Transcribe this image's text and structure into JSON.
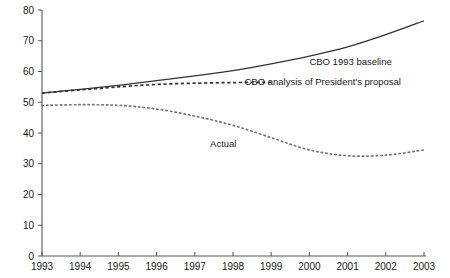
{
  "chart_data": {
    "type": "line",
    "title": "",
    "subtitle": "",
    "xlabel": "",
    "ylabel": "",
    "x": [
      1993,
      1994,
      1995,
      1996,
      1997,
      1998,
      1999,
      2000,
      2001,
      2002,
      2003
    ],
    "x_tick_labels": [
      "1993",
      "1994",
      "1995",
      "1996",
      "1997",
      "1998",
      "1999",
      "2000",
      "2001",
      "2002",
      "2003"
    ],
    "y_tick_labels": [
      "0",
      "10",
      "20",
      "30",
      "40",
      "50",
      "60",
      "70",
      "80"
    ],
    "y_ticks": [
      0,
      10,
      20,
      30,
      40,
      50,
      60,
      70,
      80
    ],
    "xlim": [
      1993,
      2003
    ],
    "ylim": [
      0,
      80
    ],
    "grid": false,
    "legend_position": "inline-annotations",
    "series": [
      {
        "name": "CBO 1993 baseline",
        "style": "solid",
        "color": "#333333",
        "x": [
          1993,
          1994,
          1995,
          1996,
          1997,
          1998,
          1999,
          2000,
          2001,
          2002,
          2003
        ],
        "values": [
          53.0,
          54.2,
          55.5,
          57.0,
          58.6,
          60.3,
          62.5,
          65.0,
          68.0,
          72.0,
          76.5
        ]
      },
      {
        "name": "CBO analysis of President's proposal",
        "style": "dashed",
        "color": "#333333",
        "x": [
          1993,
          1994,
          1995,
          1996,
          1997,
          1998,
          1999
        ],
        "values": [
          53.0,
          54.0,
          55.0,
          55.8,
          56.2,
          56.4,
          56.5
        ]
      },
      {
        "name": "Actual",
        "style": "dotted",
        "color": "#777777",
        "x": [
          1993,
          1994,
          1995,
          1996,
          1997,
          1998,
          1999,
          2000,
          2001,
          2002,
          2003
        ],
        "values": [
          49.0,
          49.2,
          49.0,
          47.8,
          45.5,
          42.5,
          38.5,
          34.5,
          32.6,
          32.8,
          34.5
        ]
      }
    ],
    "annotations": [
      {
        "text": "CBO 1993 baseline",
        "x": 2000.0,
        "y": 62.0,
        "series": "CBO 1993 baseline"
      },
      {
        "text": "CBO analysis of President's proposal",
        "x": 1998.3,
        "y": 55.5,
        "series": "CBO analysis of President's proposal"
      },
      {
        "text": "Actual",
        "x": 1997.4,
        "y": 35.5,
        "series": "Actual"
      }
    ]
  }
}
